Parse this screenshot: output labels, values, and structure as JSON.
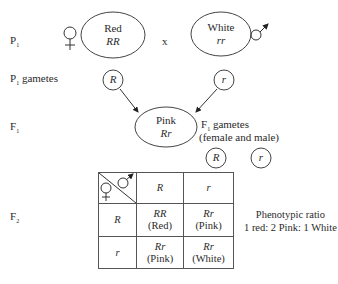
{
  "labels": {
    "p1": "P",
    "p1_sub": "1",
    "p1_gametes": "P",
    "p1_gametes_sub": "1",
    "p1_gametes_suffix": " gametes",
    "f1": "F",
    "f1_sub": "1",
    "f2": "F",
    "f2_sub": "2",
    "cross": "x"
  },
  "parents": {
    "female": {
      "phenotype": "Red",
      "genotype": "RR",
      "gamete": "R"
    },
    "male": {
      "phenotype": "White",
      "genotype": "rr",
      "gamete": "r"
    }
  },
  "f1": {
    "phenotype": "Pink",
    "genotype": "Rr",
    "gametes_label": "F",
    "gametes_label_sub": "1",
    "gametes_label_suffix": " gametes",
    "gametes_note": "(female and male)",
    "gametes": [
      "R",
      "r"
    ]
  },
  "punnett": {
    "col_headers": [
      "R",
      "r"
    ],
    "row_headers": [
      "R",
      "r"
    ],
    "cells": [
      [
        {
          "genotype": "RR",
          "phenotype": "(Red)"
        },
        {
          "genotype": "Rr",
          "phenotype": "(Pink)"
        }
      ],
      [
        {
          "genotype": "Rr",
          "phenotype": "(Pink)"
        },
        {
          "genotype": "Rr",
          "phenotype": "(White)"
        }
      ]
    ]
  },
  "ratio": {
    "title": "Phenotypic ratio",
    "value": "1 red: 2 Pink: 1 White"
  }
}
